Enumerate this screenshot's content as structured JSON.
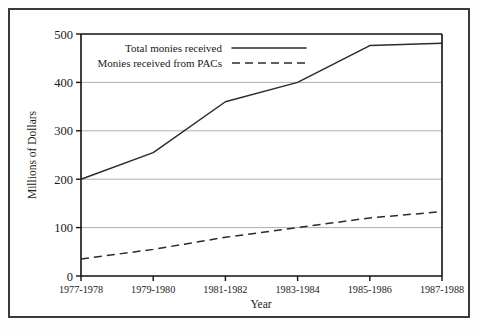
{
  "chart_data": {
    "type": "line",
    "title": "",
    "xlabel": "Year",
    "ylabel": "Millions of Dollars",
    "categories": [
      "1977-1978",
      "1979-1980",
      "1981-1982",
      "1983-1984",
      "1985-1986",
      "1987-1988"
    ],
    "series": [
      {
        "name": "Total monies received",
        "style": "solid",
        "values": [
          200,
          255,
          360,
          400,
          476,
          481
        ]
      },
      {
        "name": "Monies received from PACs",
        "style": "dashed",
        "values": [
          35,
          55,
          80,
          100,
          120,
          133
        ]
      }
    ],
    "ylim": [
      0,
      500
    ],
    "yticks": [
      0,
      100,
      200,
      300,
      400,
      500
    ],
    "ytick_labels": [
      "0",
      "100",
      "200",
      "300",
      "400",
      "500"
    ],
    "grid": "horizontal",
    "legend_position": "inside-top-left",
    "line_color": "#2b2b2b",
    "grid_color": "#8d8d8d",
    "axis_color": "#111111",
    "frame_color": "#3a3a3a"
  },
  "legend": {
    "entries": [
      {
        "label": "Total monies received",
        "style": "solid"
      },
      {
        "label": "Monies received from PACs",
        "style": "dashed"
      }
    ]
  }
}
